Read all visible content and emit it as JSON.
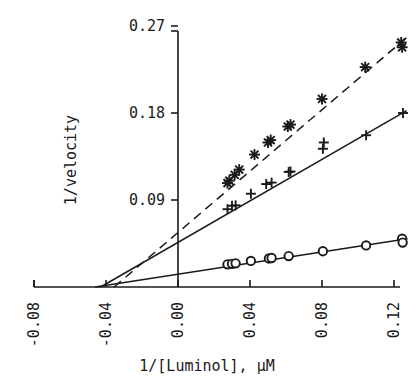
{
  "chart_data": {
    "type": "scatter",
    "title": "",
    "subtitle": "",
    "xlabel": "1/[Luminol],  μM",
    "ylabel": "1/velocity",
    "xlim": [
      -0.095,
      0.132
    ],
    "ylim": [
      0.0,
      0.285
    ],
    "grid": false,
    "legend": "none",
    "xticks": [
      -0.08,
      -0.04,
      0.0,
      0.04,
      0.08,
      0.12
    ],
    "xticklabels": [
      "-0.08",
      "-0.04",
      "0.00",
      "0.04",
      "0.08",
      "0.12"
    ],
    "yticks": [
      0.09,
      0.18,
      0.27
    ],
    "yticklabels": [
      "0.09",
      "0.18",
      "0.27"
    ],
    "xtick_rotation": 90,
    "series": [
      {
        "name": "series-star",
        "marker": "star",
        "linestyle": "dashed",
        "x": [
          0.0275,
          0.0285,
          0.0315,
          0.034,
          0.0425,
          0.05,
          0.0515,
          0.061,
          0.0625,
          0.08,
          0.104,
          0.124,
          0.1245
        ],
        "y": [
          0.1075,
          0.11,
          0.116,
          0.1215,
          0.137,
          0.1495,
          0.152,
          0.166,
          0.168,
          0.1945,
          0.2275,
          0.253,
          0.248
        ],
        "fit_x": [
          -0.0355,
          0.127
        ],
        "fit_y": [
          0.0,
          0.258
        ]
      },
      {
        "name": "series-plus",
        "marker": "plus",
        "linestyle": "solid",
        "x": [
          0.0275,
          0.03,
          0.032,
          0.0405,
          0.049,
          0.052,
          0.0615,
          0.0625,
          0.0805,
          0.081,
          0.1045,
          0.125
        ],
        "y": [
          0.0805,
          0.084,
          0.0845,
          0.0965,
          0.1065,
          0.108,
          0.119,
          0.1195,
          0.143,
          0.1495,
          0.157,
          0.18
        ],
        "fit_x": [
          -0.043,
          0.127
        ],
        "fit_y": [
          0.0,
          0.1825
        ]
      },
      {
        "name": "series-circle",
        "marker": "circle",
        "linestyle": "solid",
        "x": [
          0.0275,
          0.03,
          0.032,
          0.0405,
          0.0505,
          0.052,
          0.0615,
          0.0805,
          0.1045,
          0.1245,
          0.1248
        ],
        "y": [
          0.0235,
          0.024,
          0.0245,
          0.027,
          0.0295,
          0.03,
          0.032,
          0.037,
          0.043,
          0.05,
          0.046
        ],
        "fit_x": [
          -0.046,
          0.1275
        ],
        "fit_y": [
          0.0,
          0.05
        ]
      }
    ]
  },
  "axes": {
    "y_axis_title": "1/velocity",
    "x_axis_title": "1/[Luminol],  μM"
  }
}
